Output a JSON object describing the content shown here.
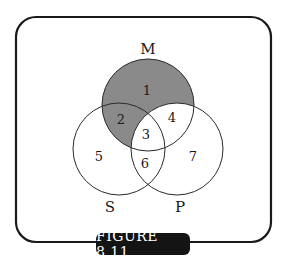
{
  "figure": {
    "caption": "FIGURE 8.11"
  },
  "colors": {
    "frame": "#1a1a1a",
    "shaded_region": "#8a8a8a",
    "circle_stroke": "#2a2a2a",
    "caption_bg": "#141414",
    "caption_text": "#ffffff"
  },
  "sets": {
    "M": {
      "label": "M"
    },
    "S": {
      "label": "S"
    },
    "P": {
      "label": "P"
    }
  },
  "regions": {
    "r1": "1",
    "r2": "2",
    "r3": "3",
    "r4": "4",
    "r5": "5",
    "r6": "6",
    "r7": "7"
  },
  "shaded_regions": [
    "1",
    "2"
  ]
}
